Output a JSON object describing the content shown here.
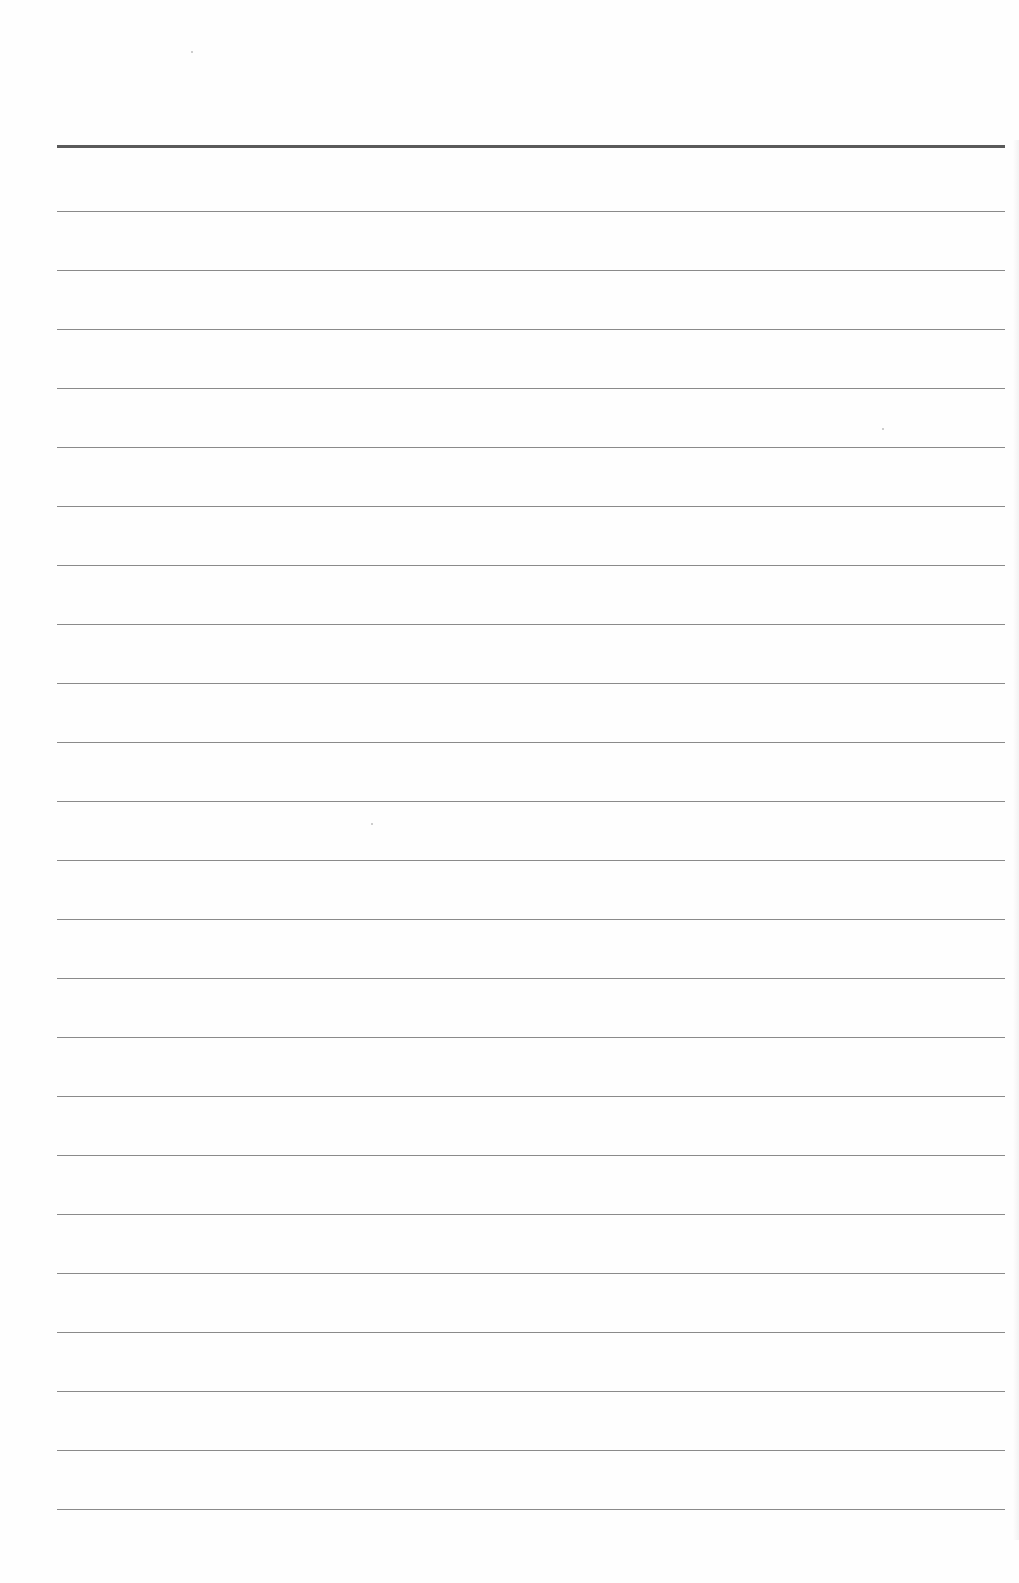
{
  "page": {
    "type": "blank ruled notebook page",
    "background_color": "#fefefe",
    "line_color": "#8a8a8a",
    "header_line_color": "#5a5a5a"
  },
  "rules": {
    "header_line": {
      "y": 145
    },
    "lines": [
      211,
      270,
      329,
      388,
      447,
      506,
      565,
      624,
      683,
      742,
      801,
      860,
      919,
      978,
      1037,
      1096,
      1155,
      1214,
      1273,
      1332,
      1391,
      1450,
      1509
    ],
    "left": 57,
    "right": 1005
  },
  "specks": [
    {
      "x": 191,
      "y": 51
    },
    {
      "x": 882,
      "y": 428
    },
    {
      "x": 371,
      "y": 823
    }
  ]
}
